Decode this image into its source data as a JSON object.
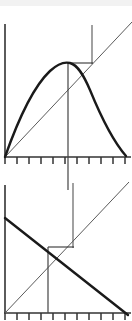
{
  "figure": {
    "title": "",
    "background_color": "#ffffff",
    "line_color": "#1a1a1a",
    "thin_line_color": "#5a5a5a",
    "axis_color": "#333333"
  },
  "chart_data": [
    {
      "type": "line",
      "panel": "upper",
      "title": "",
      "xlabel": "",
      "ylabel": "",
      "xlim": [
        0,
        1
      ],
      "ylim": [
        0,
        1
      ],
      "grid": false,
      "legend": "none",
      "axes": {
        "y_axis_x": 0.0,
        "y_axis_top": 0.985,
        "x_axis_y": 0.0,
        "x_axis_right": 1.0,
        "tick_count": 11,
        "tick_positions": [
          0.0,
          0.1,
          0.2,
          0.3,
          0.4,
          0.5,
          0.6,
          0.7,
          0.8,
          0.9,
          1.0
        ],
        "tick_labels": [
          "",
          "",
          "",
          "",
          "",
          "",
          "",
          "",
          "",
          "",
          ""
        ]
      },
      "series": [
        {
          "name": "total-curve",
          "style": "thick",
          "x": [
            0.0,
            0.05,
            0.1,
            0.15,
            0.2,
            0.25,
            0.3,
            0.35,
            0.4,
            0.45,
            0.5,
            0.55,
            0.6,
            0.65,
            0.7,
            0.75,
            0.8,
            0.85,
            0.9,
            0.95,
            1.0
          ],
          "y": [
            0.0,
            0.13,
            0.26,
            0.38,
            0.49,
            0.59,
            0.67,
            0.74,
            0.79,
            0.82,
            0.84,
            0.835,
            0.81,
            0.77,
            0.71,
            0.63,
            0.54,
            0.43,
            0.31,
            0.17,
            0.02
          ]
        },
        {
          "name": "origin-ray",
          "style": "thin",
          "x": [
            0.0,
            1.18
          ],
          "y": [
            0.0,
            1.3
          ]
        }
      ],
      "annotations": [
        {
          "name": "peak-horizontal-connector",
          "type": "hline",
          "x_start": 0.505,
          "x_end": 0.69,
          "y": 0.845
        },
        {
          "name": "tangency-vertical",
          "type": "vline",
          "x": 0.69,
          "y_top": 1.2,
          "y_bottom": 0.845
        },
        {
          "name": "peak-dropline",
          "type": "vline",
          "x": 0.505,
          "y_top": 0.845,
          "y_bottom": -0.23
        }
      ]
    },
    {
      "type": "line",
      "panel": "lower",
      "title": "",
      "xlabel": "",
      "ylabel": "",
      "xlim": [
        0,
        1
      ],
      "ylim": [
        0,
        1
      ],
      "grid": false,
      "legend": "none",
      "axes": {
        "y_axis_x": 0.0,
        "y_axis_top": 1.0,
        "x_axis_y": 0.0,
        "x_axis_right": 1.0,
        "tick_count": 11,
        "tick_positions": [
          0.0,
          0.1,
          0.2,
          0.3,
          0.4,
          0.5,
          0.6,
          0.7,
          0.8,
          0.9,
          1.0
        ],
        "tick_labels": [
          "",
          "",
          "",
          "",
          "",
          "",
          "",
          "",
          "",
          "",
          ""
        ]
      },
      "series": [
        {
          "name": "marginal-curve",
          "style": "thick",
          "x": [
            0.0,
            1.0
          ],
          "y": [
            0.74,
            -0.02
          ]
        },
        {
          "name": "average-ray",
          "style": "thin",
          "x": [
            0.0,
            1.05
          ],
          "y": [
            0.0,
            1.08
          ]
        }
      ],
      "annotations": [
        {
          "name": "intersection-horizontal-connector",
          "type": "hline",
          "x_start": 0.36,
          "x_end": 0.565,
          "y": 0.495
        },
        {
          "name": "intersection-dropline",
          "type": "vline",
          "x": 0.36,
          "y_top": 0.495,
          "y_bottom": 0.0
        },
        {
          "name": "upper-link-vertical",
          "type": "vline",
          "x": 0.565,
          "y_top": 1.06,
          "y_bottom": 0.495
        }
      ]
    }
  ]
}
